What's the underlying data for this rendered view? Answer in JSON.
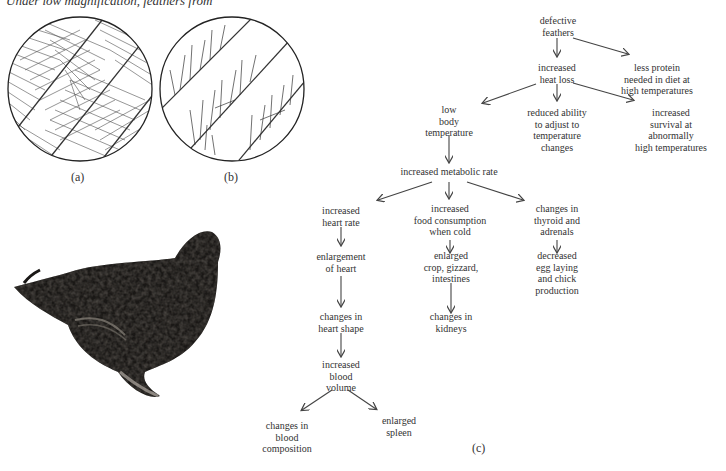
{
  "caption": "Under low magnification, feathers from",
  "panels": {
    "a": {
      "label": "(a)",
      "description": "normal feather, dense barbs"
    },
    "b": {
      "label": "(b)",
      "description": "defective feather, sparse frizzled barbs"
    },
    "c": {
      "label": "(c)"
    }
  },
  "photo": {
    "description": "frizzled chicken photograph"
  },
  "flow": {
    "defective_feathers": [
      "defective",
      "feathers"
    ],
    "increased_heat_loss": [
      "increased",
      "heat loss"
    ],
    "less_protein": [
      "less protein",
      "needed in diet at",
      "high temperatures"
    ],
    "low_body_temp": [
      "low",
      "body",
      "temperature"
    ],
    "reduced_ability": [
      "reduced ability",
      "to adjust to",
      "temperature",
      "changes"
    ],
    "increased_survival": [
      "increased",
      "survival at",
      "abnormally",
      "high temperatures"
    ],
    "metabolic_rate": [
      "increased metabolic rate"
    ],
    "heart_rate": [
      "increased",
      "heart rate"
    ],
    "food_consumption": [
      "increased",
      "food consumption",
      "when cold"
    ],
    "thyroid": [
      "changes in",
      "thyroid and",
      "adrenals"
    ],
    "enlargement_heart": [
      "enlargement",
      "of heart"
    ],
    "enlarged_crop": [
      "enlarged",
      "crop, gizzard,",
      "intestines"
    ],
    "decreased_egg": [
      "decreased",
      "egg laying",
      "and chick",
      "production"
    ],
    "heart_shape": [
      "changes in",
      "heart shape"
    ],
    "kidneys": [
      "changes in",
      "kidneys"
    ],
    "blood_volume": [
      "increased",
      "blood",
      "volume"
    ],
    "blood_composition": [
      "changes in",
      "blood",
      "composition"
    ],
    "spleen": [
      "enlarged",
      "spleen"
    ]
  }
}
